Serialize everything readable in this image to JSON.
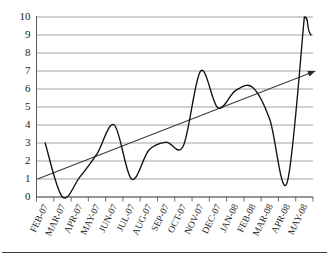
{
  "chart_data": {
    "type": "line",
    "title": "",
    "subtitle": "",
    "xlabel": "",
    "ylabel": "",
    "ylim": [
      0,
      10
    ],
    "ytick_values": [
      0,
      1,
      2,
      3,
      4,
      5,
      6,
      7,
      8,
      9,
      10
    ],
    "ytick_labels": [
      "0",
      "1",
      "2",
      "3",
      "4",
      "5",
      "6",
      "7",
      "8",
      "9",
      "10"
    ],
    "grid": true,
    "grid_axis": "y",
    "legend": false,
    "legend_position": "none",
    "categories": [
      "FEB-07",
      "MAR-07",
      "APR-07",
      "MAY-07",
      "JUN-07",
      "JUL-07",
      "AUG-07",
      "SEP-07",
      "OCT-07",
      "NOV-07",
      "DEC-07",
      "JAN-08",
      "FEB-08",
      "MAR-08",
      "APR-08",
      "MAY-08"
    ],
    "series": [
      {
        "name": "value",
        "color": "#111111",
        "smoothing": "spline",
        "values": [
          3.0,
          0.0,
          1.1,
          2.4,
          4.0,
          1.0,
          2.6,
          3.05,
          2.85,
          7.0,
          4.95,
          5.9,
          6.1,
          4.3,
          0.8,
          10.0
        ]
      }
    ],
    "annotations": [
      {
        "name": "trend-arrow",
        "type": "arrow",
        "color": "#3a3a3a",
        "from": {
          "category": "FEB-07",
          "value": 1.0
        },
        "to": {
          "category": "MAY-08",
          "value": 7.0
        }
      }
    ],
    "endpoint_note": "curve descends from peak 10 at APR-08 to about 9 at right edge"
  },
  "axis": {
    "y_axis_name": "y-axis",
    "x_axis_name": "x-axis",
    "tick_count_x": 17
  },
  "colors": {
    "curve": "#111111",
    "trend": "#3a3a3a",
    "gridline": "#8c8c8c",
    "axis": "#5a5a5a",
    "text": "#1a1a1a",
    "background": "#ffffff"
  }
}
